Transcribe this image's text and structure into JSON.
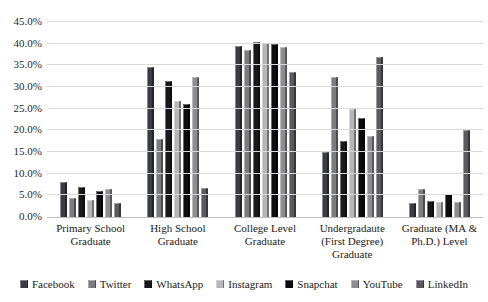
{
  "chart_data": {
    "type": "bar",
    "title": "",
    "categories": [
      "Primary School Graduate",
      "High School Graduate",
      "College Level Graduate",
      "Undergradaute (First Degree) Graduate",
      "Graduate (MA & Ph.D.) Level"
    ],
    "series": [
      {
        "name": "Facebook",
        "color": "#3b3b46",
        "values": [
          8.0,
          34.6,
          39.5,
          15.0,
          3.2
        ]
      },
      {
        "name": "Twitter",
        "color": "#7b7b80",
        "values": [
          4.5,
          18.1,
          38.5,
          32.3,
          6.5
        ]
      },
      {
        "name": "WhatsApp",
        "color": "#18181d",
        "values": [
          7.0,
          31.5,
          40.5,
          17.6,
          3.7
        ]
      },
      {
        "name": "Instagram",
        "color": "#b6b6ba",
        "values": [
          4.0,
          26.7,
          40.2,
          25.0,
          3.5
        ]
      },
      {
        "name": "Snapchat",
        "color": "#0c0c10",
        "values": [
          6.0,
          26.1,
          40.0,
          22.8,
          5.2
        ]
      },
      {
        "name": "YouTube",
        "color": "#8e8e92",
        "values": [
          6.5,
          32.3,
          39.3,
          18.8,
          3.5
        ]
      },
      {
        "name": "LinkedIn",
        "color": "#5a5a60",
        "values": [
          3.3,
          6.8,
          33.5,
          37.0,
          20.0
        ]
      }
    ],
    "ylim": [
      0,
      45
    ],
    "ytick_step": 5,
    "yticks": [
      "0.0%",
      "5.0%",
      "10.0%",
      "15.0%",
      "20.0%",
      "25.0%",
      "30.0%",
      "35.0%",
      "40.0%",
      "45.0%"
    ],
    "xlabel": "",
    "ylabel": "",
    "grid": true,
    "legend_position": "bottom",
    "colors": {
      "gridline": "#d9d9d9",
      "axis_line": "#bfbfbf",
      "text": "#1a1a1a"
    }
  }
}
